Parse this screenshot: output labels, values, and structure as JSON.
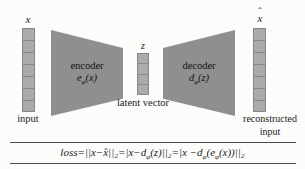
{
  "diagram": {
    "input": {
      "symbol": "x",
      "caption": "input"
    },
    "encoder": {
      "title": "encoder",
      "fn_base": "e",
      "fn_sub": "φ",
      "fn_args": "(x)"
    },
    "latent": {
      "symbol": "z",
      "caption": "latent vector"
    },
    "decoder": {
      "title": "decoder",
      "fn_base": "d",
      "fn_sub": "φ",
      "fn_args": "(z)"
    },
    "output": {
      "hat": "ˆ",
      "symbol": "x",
      "caption_line1": "reconstructed",
      "caption_line2": "input"
    }
  },
  "formula": {
    "prefix": "loss=||x−x̂||₂=|x−d",
    "sub1": "φ",
    "mid1": "(z)||₂=|x −d",
    "sub2": "φ",
    "mid2": "(e",
    "sub3": "φ",
    "suffix": "(x))||₂"
  },
  "colors": {
    "trapezoid": "#8f8f8f",
    "vector_fill": "#ababab",
    "vector_border": "#878787",
    "rule": "#4a4a4a",
    "background": "#fcfcfb",
    "text": "#1a1a1a"
  }
}
